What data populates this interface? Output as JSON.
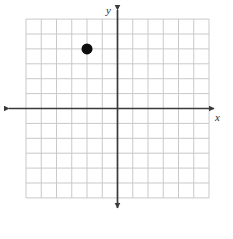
{
  "chart_data": {
    "type": "scatter",
    "title": "",
    "subtitle": "",
    "xlabel": "x",
    "ylabel": "y",
    "xlim": [
      -6,
      6
    ],
    "ylim": [
      -6,
      6
    ],
    "grid": true,
    "grid_step": 1,
    "legend": "none",
    "x_axis_arrows": "both",
    "y_axis_arrows": "both",
    "tick_labels": [],
    "annotations": [],
    "points": [
      {
        "label": "plotted-point",
        "x": -2,
        "y": 4
      }
    ],
    "series": [
      {
        "name": "plotted-point",
        "x": [
          -2
        ],
        "y": [
          4
        ],
        "marker": "filled-circle",
        "marker_size": 11,
        "color": "#0d0d0d"
      }
    ]
  },
  "style": {
    "background": "#ffffff",
    "grid_color": "#c9c9c9",
    "axis_color": "#3a3a3a",
    "point_color": "#0d0d0d",
    "label_color": "#2b2b2b"
  },
  "geometry": {
    "grid_left": 26,
    "grid_top": 19,
    "grid_right": 209,
    "grid_bottom": 198,
    "cell_w": 15.25,
    "cell_h": 14.9,
    "origin_x": 117.5,
    "origin_y": 108.5,
    "x_axis_left_tip": 9,
    "x_axis_right_tip": 214,
    "y_axis_top_tip": 10,
    "y_axis_bottom_tip": 208
  },
  "labels": {
    "x_axis": "x",
    "y_axis": "y"
  }
}
